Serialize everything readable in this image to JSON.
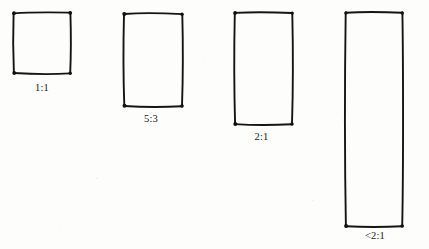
{
  "sketch": {
    "title": "Aspect ratio rectangle sketch",
    "background_color": "#fdfdfc",
    "ink_color": "#151515",
    "figures": [
      {
        "name": "square-1-1",
        "label": "1:1",
        "x": 12,
        "y": 11,
        "width": 60,
        "height": 64,
        "label_x": 12,
        "label_y": 82,
        "label_width": 60
      },
      {
        "name": "rectangle-5-3",
        "label": "5:3",
        "x": 122,
        "y": 12,
        "width": 62,
        "height": 96,
        "label_x": 120,
        "label_y": 113,
        "label_width": 62
      },
      {
        "name": "rectangle-2-1",
        "label": "2:1",
        "x": 233,
        "y": 11,
        "width": 61,
        "height": 115,
        "label_x": 231,
        "label_y": 131,
        "label_width": 61
      },
      {
        "name": "rectangle-less-than-2-1",
        "label": "<2:1",
        "x": 344,
        "y": 11,
        "width": 60,
        "height": 217,
        "label_x": 344,
        "label_y": 230,
        "label_width": 62
      }
    ]
  }
}
